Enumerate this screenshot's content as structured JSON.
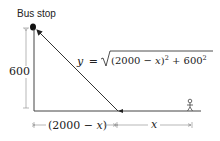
{
  "diagram": {
    "bus_stop_label": "Bus stop",
    "vertical_dimension_label": "600",
    "equation": {
      "lhs": "y",
      "equals": "=",
      "radicand_part1": "(2000 − ",
      "radicand_var": "x",
      "radicand_part2": ")",
      "exp1": "2",
      "radicand_part3": " + 600",
      "exp2": "2"
    },
    "bottom_left_label_open": "(2000 − ",
    "bottom_left_label_var": "x",
    "bottom_left_label_close": ")",
    "bottom_right_label": "x",
    "colors": {
      "line": "#333333",
      "dimension": "#777777",
      "text": "#222222",
      "dot": "#111111"
    }
  }
}
